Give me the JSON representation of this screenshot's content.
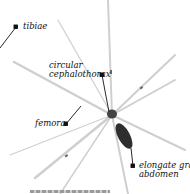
{
  "diagram": {
    "colors": {
      "background": "#ffffff",
      "leader": "#111111",
      "leg": "#c8c8c8",
      "body": "#2a2a2a"
    },
    "labels": [
      {
        "id": "tibiae",
        "text": "tibiae"
      },
      {
        "id": "cephalothorax",
        "line1": "circular",
        "line2": "cephalothorax"
      },
      {
        "id": "femora",
        "text": "femora"
      },
      {
        "id": "abdomen",
        "line1": "elongate gray",
        "line2": "abdomen"
      }
    ]
  }
}
